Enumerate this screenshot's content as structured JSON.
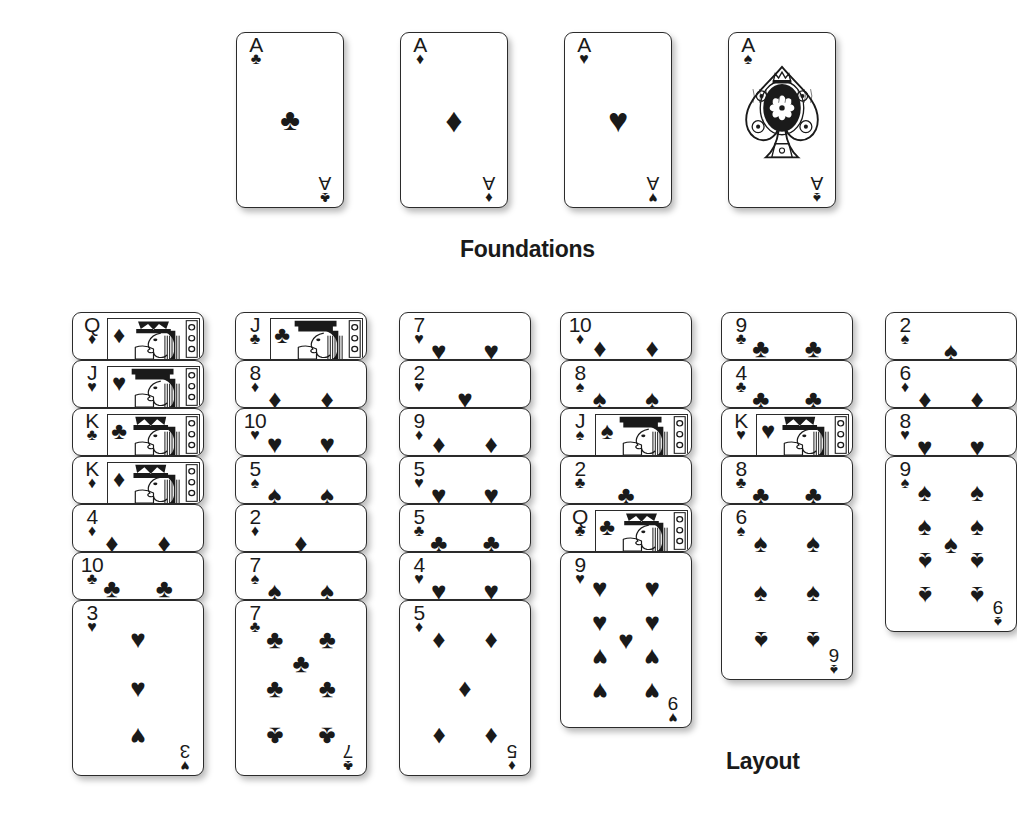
{
  "labels": {
    "foundations": "Foundations",
    "layout": "Layout"
  },
  "suits": {
    "club": "♣",
    "diamond": "♦",
    "heart": "♥",
    "spade": "♠"
  },
  "foundations": {
    "title": "Foundations",
    "cards": [
      {
        "rank": "A",
        "suit": "club",
        "suit_char": "♣",
        "name": "ace-of-clubs",
        "ornate": false
      },
      {
        "rank": "A",
        "suit": "diamond",
        "suit_char": "♦",
        "name": "ace-of-diamonds",
        "ornate": false
      },
      {
        "rank": "A",
        "suit": "heart",
        "suit_char": "♥",
        "name": "ace-of-hearts",
        "ornate": false
      },
      {
        "rank": "A",
        "suit": "spade",
        "suit_char": "♠",
        "name": "ace-of-spades",
        "ornate": true
      }
    ]
  },
  "layout": {
    "title": "Layout",
    "columns": [
      {
        "index": 1,
        "cards": [
          {
            "rank": "Q",
            "suit": "diamond",
            "suit_char": "♦",
            "court": true,
            "face_up": true
          },
          {
            "rank": "J",
            "suit": "heart",
            "suit_char": "♥",
            "court": true,
            "face_up": true
          },
          {
            "rank": "K",
            "suit": "club",
            "suit_char": "♣",
            "court": true,
            "face_up": true
          },
          {
            "rank": "K",
            "suit": "diamond",
            "suit_char": "♦",
            "court": true,
            "face_up": true
          },
          {
            "rank": "4",
            "suit": "diamond",
            "suit_char": "♦",
            "court": false,
            "face_up": true
          },
          {
            "rank": "10",
            "suit": "club",
            "suit_char": "♣",
            "court": false,
            "face_up": true
          },
          {
            "rank": "3",
            "suit": "heart",
            "suit_char": "♥",
            "court": false,
            "face_up": true,
            "bottom": true
          }
        ]
      },
      {
        "index": 2,
        "cards": [
          {
            "rank": "J",
            "suit": "club",
            "suit_char": "♣",
            "court": true,
            "face_up": true
          },
          {
            "rank": "8",
            "suit": "diamond",
            "suit_char": "♦",
            "court": false,
            "face_up": true
          },
          {
            "rank": "10",
            "suit": "heart",
            "suit_char": "♥",
            "court": false,
            "face_up": true
          },
          {
            "rank": "5",
            "suit": "spade",
            "suit_char": "♠",
            "court": false,
            "face_up": true
          },
          {
            "rank": "2",
            "suit": "diamond",
            "suit_char": "♦",
            "court": false,
            "face_up": true
          },
          {
            "rank": "7",
            "suit": "spade",
            "suit_char": "♠",
            "court": false,
            "face_up": true
          },
          {
            "rank": "7",
            "suit": "club",
            "suit_char": "♣",
            "court": false,
            "face_up": true,
            "bottom": true
          }
        ]
      },
      {
        "index": 3,
        "cards": [
          {
            "rank": "7",
            "suit": "heart",
            "suit_char": "♥",
            "court": false,
            "face_up": true
          },
          {
            "rank": "2",
            "suit": "heart",
            "suit_char": "♥",
            "court": false,
            "face_up": true
          },
          {
            "rank": "9",
            "suit": "diamond",
            "suit_char": "♦",
            "court": false,
            "face_up": true
          },
          {
            "rank": "5",
            "suit": "heart",
            "suit_char": "♥",
            "court": false,
            "face_up": true
          },
          {
            "rank": "5",
            "suit": "club",
            "suit_char": "♣",
            "court": false,
            "face_up": true
          },
          {
            "rank": "4",
            "suit": "heart",
            "suit_char": "♥",
            "court": false,
            "face_up": true
          },
          {
            "rank": "5",
            "suit": "diamond",
            "suit_char": "♦",
            "court": false,
            "face_up": true,
            "bottom": true
          }
        ]
      },
      {
        "index": 4,
        "cards": [
          {
            "rank": "10",
            "suit": "diamond",
            "suit_char": "♦",
            "court": false,
            "face_up": true
          },
          {
            "rank": "8",
            "suit": "spade",
            "suit_char": "♠",
            "court": false,
            "face_up": true
          },
          {
            "rank": "J",
            "suit": "spade",
            "suit_char": "♠",
            "court": true,
            "face_up": true
          },
          {
            "rank": "2",
            "suit": "club",
            "suit_char": "♣",
            "court": false,
            "face_up": true
          },
          {
            "rank": "Q",
            "suit": "club",
            "suit_char": "♣",
            "court": true,
            "face_up": true
          },
          {
            "rank": "9",
            "suit": "heart",
            "suit_char": "♥",
            "court": false,
            "face_up": true,
            "bottom": true
          }
        ]
      },
      {
        "index": 5,
        "cards": [
          {
            "rank": "9",
            "suit": "club",
            "suit_char": "♣",
            "court": false,
            "face_up": true
          },
          {
            "rank": "4",
            "suit": "club",
            "suit_char": "♣",
            "court": false,
            "face_up": true
          },
          {
            "rank": "K",
            "suit": "heart",
            "suit_char": "♥",
            "court": true,
            "face_up": true
          },
          {
            "rank": "8",
            "suit": "club",
            "suit_char": "♣",
            "court": false,
            "face_up": true
          },
          {
            "rank": "6",
            "suit": "spade",
            "suit_char": "♠",
            "court": false,
            "face_up": true,
            "bottom": true
          }
        ]
      },
      {
        "index": 6,
        "cards": [
          {
            "rank": "2",
            "suit": "spade",
            "suit_char": "♠",
            "court": false,
            "face_up": true
          },
          {
            "rank": "6",
            "suit": "diamond",
            "suit_char": "♦",
            "court": false,
            "face_up": true
          },
          {
            "rank": "8",
            "suit": "heart",
            "suit_char": "♥",
            "court": false,
            "face_up": true
          },
          {
            "rank": "9",
            "suit": "spade",
            "suit_char": "♠",
            "court": false,
            "face_up": true,
            "bottom": true
          }
        ]
      }
    ]
  },
  "colors": {
    "card_face": "#ffffff",
    "card_border": "#2b2b2b",
    "ink": "#1a1a1a",
    "background": "#ffffff"
  },
  "geometry": {
    "foundation_card": {
      "width": 108,
      "height": 176,
      "top": 32,
      "left_start": 236,
      "gap": 164
    },
    "tableau_card": {
      "width": 132,
      "collapsed_height": 48,
      "full_height": 176,
      "overlap": 48,
      "top": 312
    },
    "tableau_columns_left": [
      72,
      235,
      399,
      560,
      721,
      885
    ],
    "foundations_label": {
      "left": 460,
      "top": 236
    },
    "layout_label": {
      "left": 726,
      "top": 748
    }
  }
}
